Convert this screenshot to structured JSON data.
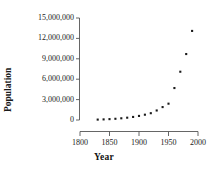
{
  "chart_data": {
    "type": "scatter",
    "title": "",
    "xlabel": "Year",
    "ylabel": "Population",
    "xlim": [
      1800,
      2000
    ],
    "ylim": [
      0,
      15000000
    ],
    "xticks": [
      1800,
      1850,
      1900,
      1950,
      2000
    ],
    "xtick_labels": [
      "1800",
      "1850",
      "1900",
      "1950",
      "2000"
    ],
    "yticks": [
      0,
      3000000,
      6000000,
      9000000,
      12000000,
      15000000
    ],
    "ytick_labels": [
      "0",
      "3,000,000",
      "6,000,000",
      "9,000,000",
      "12,000,000",
      "15,000,000"
    ],
    "grid": false,
    "legend": false,
    "marker": "square",
    "marker_color": "#1a1a1a",
    "series": [
      {
        "name": "Population",
        "x": [
          1830,
          1840,
          1850,
          1860,
          1870,
          1880,
          1890,
          1900,
          1910,
          1920,
          1930,
          1940,
          1950,
          1960,
          1970,
          1980,
          1990
        ],
        "y": [
          60000,
          90000,
          130000,
          180000,
          250000,
          340000,
          450000,
          600000,
          780000,
          1000000,
          1400000,
          1900000,
          2400000,
          4700000,
          7100000,
          9700000,
          13100000
        ]
      }
    ]
  },
  "axes": {
    "x_title": "Year",
    "y_title": "Population"
  },
  "colors": {
    "axis": "#4d4d4d",
    "marker": "#1a1a1a",
    "text": "#1a1a1a",
    "background": "#ffffff"
  }
}
